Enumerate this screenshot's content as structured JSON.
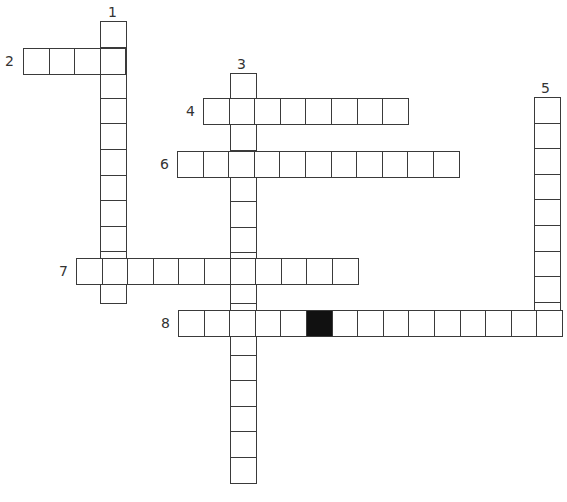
{
  "puzzle": {
    "cell_size": 25.6,
    "words": [
      {
        "number": "1",
        "direction": "down",
        "x": 100,
        "y": 21,
        "length": 11,
        "label_x": 108,
        "label_y": 5,
        "black": []
      },
      {
        "number": "2",
        "direction": "across",
        "x": 23,
        "y": 48,
        "length": 4,
        "label_x": 5,
        "label_y": 54,
        "black": []
      },
      {
        "number": "3",
        "direction": "down",
        "x": 230,
        "y": 73,
        "length": 16,
        "label_x": 237,
        "label_y": 57,
        "black": []
      },
      {
        "number": "4",
        "direction": "across",
        "x": 203,
        "y": 98,
        "length": 8,
        "label_x": 186,
        "label_y": 104,
        "black": []
      },
      {
        "number": "5",
        "direction": "down",
        "x": 534,
        "y": 97,
        "length": 9,
        "label_x": 541,
        "label_y": 81,
        "black": []
      },
      {
        "number": "6",
        "direction": "across",
        "x": 177,
        "y": 151,
        "length": 11,
        "label_x": 160,
        "label_y": 157,
        "black": []
      },
      {
        "number": "7",
        "direction": "across",
        "x": 76,
        "y": 258,
        "length": 11,
        "label_x": 59,
        "label_y": 264,
        "black": []
      },
      {
        "number": "8",
        "direction": "across",
        "x": 178,
        "y": 310,
        "length": 15,
        "label_x": 161,
        "label_y": 316,
        "black": [
          5
        ]
      }
    ]
  }
}
